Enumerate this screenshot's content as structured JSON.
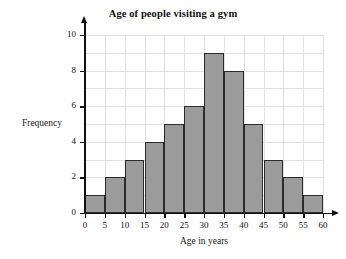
{
  "chart_data": {
    "type": "bar",
    "title": "Age of people visiting a gym",
    "xlabel": "Age in years",
    "ylabel": "Frequency",
    "categories": [
      "0-5",
      "5-10",
      "10-15",
      "15-20",
      "20-25",
      "25-30",
      "30-35",
      "35-40",
      "40-45",
      "45-50",
      "50-55",
      "55-60"
    ],
    "bin_edges": [
      0,
      5,
      10,
      15,
      20,
      25,
      30,
      35,
      40,
      45,
      50,
      55,
      60
    ],
    "values": [
      1,
      2,
      3,
      4,
      5,
      6,
      9,
      8,
      5,
      3,
      2,
      1
    ],
    "xlim": [
      0,
      60
    ],
    "ylim": [
      0,
      10
    ],
    "xticks": [
      0,
      5,
      10,
      15,
      20,
      25,
      30,
      35,
      40,
      45,
      50,
      55,
      60
    ],
    "xtick_labels": [
      "0",
      "5",
      "10",
      "15",
      "20",
      "25",
      "30",
      "35",
      "40",
      "45",
      "50",
      "55",
      "60"
    ],
    "yticks": [
      0,
      2,
      4,
      6,
      8,
      10
    ],
    "ytick_labels": [
      "0",
      "2",
      "4",
      "6",
      "8",
      "10"
    ],
    "grid": true,
    "grid_y_step": 1,
    "grid_x_step": 5,
    "legend": "none",
    "colors": {
      "bar_fill": "#9b9b9b",
      "bar_edge": "#2b2b2b",
      "gridline": "#e2e2e2",
      "axis": "#111111",
      "background": "#ffffff",
      "text": "#1a1a1a"
    }
  }
}
